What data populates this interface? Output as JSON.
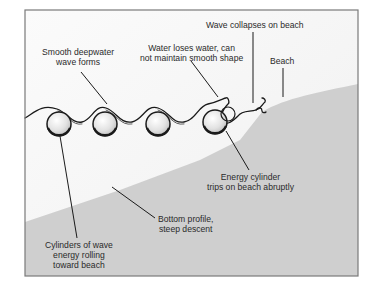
{
  "diagram": {
    "colors": {
      "frame": "#7a7a7a",
      "water_background": "#f7f7f7",
      "seabed_fill": "#cfcfcf",
      "wave_line": "#1a1a1a",
      "cylinder_fill": "#e6e6e6",
      "text": "#2a2a2a"
    },
    "labels": {
      "smooth_deepwater": {
        "line1": "Smooth deepwater",
        "line2": "wave forms"
      },
      "water_loses": {
        "line1": "Water loses water, can",
        "line2": "not maintain smooth shape"
      },
      "wave_collapses": {
        "line1": "Wave collapses on beach"
      },
      "beach": {
        "line1": "Beach"
      },
      "energy_cylinder": {
        "line1": "Energy cylinder",
        "line2": "trips on beach abruptly"
      },
      "bottom_profile": {
        "line1": "Bottom profile,",
        "line2": "steep descent"
      },
      "cylinders_rolling": {
        "line1": "Cylinders of wave",
        "line2": "energy rolling",
        "line3": "toward beach"
      }
    },
    "cylinders": [
      {
        "name": "cylinder-1",
        "cx": 59,
        "cy": 124,
        "r": 12
      },
      {
        "name": "cylinder-2",
        "cx": 105,
        "cy": 124,
        "r": 12
      },
      {
        "name": "cylinder-3",
        "cx": 158,
        "cy": 124,
        "r": 12
      },
      {
        "name": "cylinder-4",
        "cx": 216,
        "cy": 122,
        "r": 12
      }
    ]
  }
}
